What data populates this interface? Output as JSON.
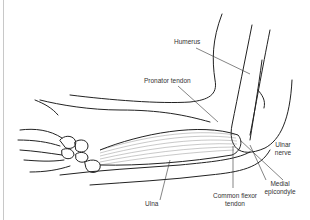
{
  "figure": {
    "labels": {
      "humerus": "Humerus",
      "pronator_tendon": "Pronator tendon",
      "ulnar_nerve_1": "Ulnar",
      "ulnar_nerve_2": "nerve",
      "medial_epicondyle_1": "Medial",
      "medial_epicondyle_2": "epicondyle",
      "ulna": "Ulna",
      "common_flexor_1": "Common flexor",
      "common_flexor_2": "tendon"
    },
    "colors": {
      "line": "#222222",
      "leader": "#333333",
      "background": "#ffffff",
      "muscle_fiber": "#888888"
    }
  }
}
